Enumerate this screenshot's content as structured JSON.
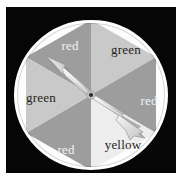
{
  "image": {
    "kind": "spinner-wheel-photo",
    "background_color": "#ffffff",
    "frame_color": "#060606",
    "rim_color": "#fdfdfd"
  },
  "wheel": {
    "title": "spinner",
    "center_hub_color": "#2b2b2b",
    "sector_count": 6,
    "sectors": [
      {
        "label": "red",
        "position": "top-left",
        "start_angle": -90,
        "end_angle": -30,
        "fill": "#9d9d9d",
        "text_color": "#f2f2f2",
        "label_x": 64,
        "label_y": 38
      },
      {
        "label": "green",
        "position": "top-right",
        "start_angle": -90,
        "end_angle": -30,
        "fill": "#c9c9c9",
        "text_color": "#231f20",
        "label_x": 120,
        "label_y": 42
      },
      {
        "label": "red",
        "position": "right",
        "start_angle": -30,
        "end_angle": 30,
        "fill": "#9d9d9d",
        "text_color": "#f2f2f2",
        "label_x": 143,
        "label_y": 93
      },
      {
        "label": "yellow",
        "position": "bottom-right",
        "start_angle": 30,
        "end_angle": 90,
        "fill": "#ededed",
        "text_color": "#231f20",
        "label_x": 117,
        "label_y": 137
      },
      {
        "label": "red",
        "position": "bottom-left",
        "start_angle": 90,
        "end_angle": 150,
        "fill": "#9d9d9d",
        "text_color": "#f2f2f2",
        "label_x": 60,
        "label_y": 142
      },
      {
        "label": "green",
        "position": "left",
        "start_angle": 150,
        "end_angle": 210,
        "fill": "#c9c9c9",
        "text_color": "#231f20",
        "label_x": 35,
        "label_y": 90
      }
    ],
    "pointer": {
      "name": "spinner-arrow",
      "points_to_label": "red",
      "points_to_position": "top-left",
      "head_angle_deg": -132,
      "body_color": "#e8e8e8",
      "shadow_color": "#7e7e7e"
    }
  }
}
